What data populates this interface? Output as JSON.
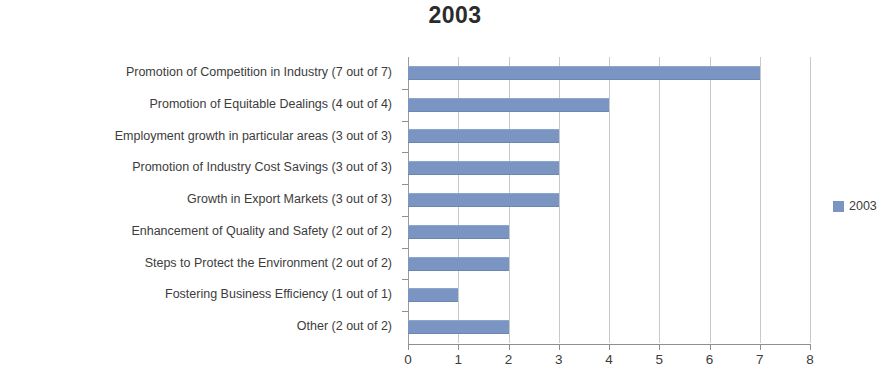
{
  "chart_data": {
    "type": "bar",
    "orientation": "horizontal",
    "title": "2003",
    "xlabel": "",
    "ylabel": "",
    "xlim": [
      0,
      8
    ],
    "xticks": [
      "0",
      "1",
      "2",
      "3",
      "4",
      "5",
      "6",
      "7",
      "8"
    ],
    "grid": "vertical",
    "legend_position": "right",
    "series": [
      {
        "name": "2003",
        "color": "#7a95c2",
        "values": [
          7,
          4,
          3,
          3,
          3,
          2,
          2,
          1,
          2
        ]
      }
    ],
    "categories": [
      "Promotion of Competition in Industry (7 out of 7)",
      "Promotion of Equitable Dealings (4 out of 4)",
      "Employment growth in particular areas (3 out of 3)",
      "Promotion of Industry Cost Savings (3 out of 3)",
      "Growth in Export Markets (3 out of 3)",
      "Enhancement of Quality and Safety (2 out of 2)",
      "Steps to Protect the Environment (2 out of 2)",
      "Fostering Business Efficiency (1 out of 1)",
      "Other (2 out of 2)"
    ]
  },
  "legend": {
    "entries": [
      {
        "label": "2003",
        "color": "#7a95c2"
      }
    ]
  },
  "colors": {
    "bar": "#7a95c2",
    "gridline": "#c9c9c9",
    "axis": "#8f8f8f",
    "text": "#3c3c3c",
    "background": "#ffffff"
  }
}
